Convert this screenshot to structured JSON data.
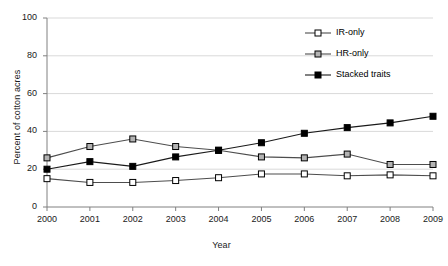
{
  "chart_data": {
    "type": "line",
    "title": "",
    "xlabel": "Year",
    "ylabel": "Percent of cotton acres",
    "x": [
      2000,
      2001,
      2002,
      2003,
      2004,
      2005,
      2006,
      2007,
      2008,
      2009
    ],
    "xtick_labels": [
      "2000",
      "2001",
      "2002",
      "2003",
      "2004",
      "2005",
      "2006",
      "2007",
      "2008",
      "2009"
    ],
    "ytick_labels": [
      "0",
      "20",
      "40",
      "60",
      "80",
      "100"
    ],
    "yticks": [
      0,
      20,
      40,
      60,
      80,
      100
    ],
    "ylim": [
      0,
      100
    ],
    "grid": "horizontal",
    "legend_position": "upper-right-inside",
    "series": [
      {
        "name": "IR-only",
        "marker": "open-square",
        "marker_fill": "#ffffff",
        "line_color": "#4d4d4d",
        "values": [
          15,
          13,
          13,
          14,
          15.5,
          17.5,
          17.5,
          16.5,
          17,
          16.5
        ]
      },
      {
        "name": "HR-only",
        "marker": "gray-square",
        "marker_fill": "#b3b3b3",
        "line_color": "#4d4d4d",
        "values": [
          26,
          32,
          36,
          32,
          30,
          26.5,
          26,
          28,
          22.5,
          22.5
        ]
      },
      {
        "name": "Stacked traits",
        "marker": "filled-square",
        "marker_fill": "#000000",
        "line_color": "#1a1a1a",
        "values": [
          20,
          24,
          21.5,
          26.5,
          30,
          34,
          39,
          42,
          44.5,
          48
        ]
      }
    ]
  },
  "legend": {
    "items": [
      {
        "label": "IR-only"
      },
      {
        "label": "HR-only"
      },
      {
        "label": "Stacked traits"
      }
    ]
  },
  "axes": {
    "x_title": "Year",
    "y_title": "Percent of cotton acres"
  },
  "colors": {
    "axis": "#808080",
    "grid": "#d9d9d9",
    "text": "#1a1a1a",
    "series_dark": "#1a1a1a",
    "series_mid": "#4d4d4d",
    "marker_gray": "#b3b3b3"
  }
}
